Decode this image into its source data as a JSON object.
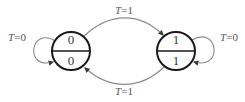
{
  "diagram": {
    "type": "state-transition-diagram",
    "background_color": "#ffffff",
    "state_stroke_color": "#1a1a1a",
    "edge_stroke_color": "#8a8a8a",
    "text_color": "#3a3a3a",
    "states": [
      {
        "id": "state-left",
        "top_value": "0",
        "bottom_value": "0",
        "cx": 71,
        "cy": 51,
        "r": 19
      },
      {
        "id": "state-right",
        "top_value": "1",
        "bottom_value": "1",
        "cx": 176,
        "cy": 51,
        "r": 19
      }
    ],
    "transitions": [
      {
        "id": "self-loop-left",
        "label_var": "T",
        "label_eq": "=0",
        "label_full": "T=0",
        "from": "state-left",
        "to": "state-left",
        "label_x": 17,
        "label_y": 38
      },
      {
        "id": "left-to-right",
        "label_var": "T",
        "label_eq": "=1",
        "label_full": "T=1",
        "from": "state-left",
        "to": "state-right",
        "label_x": 124,
        "label_y": 11
      },
      {
        "id": "right-to-left",
        "label_var": "T",
        "label_eq": "=1",
        "label_full": "T=1",
        "from": "state-right",
        "to": "state-left",
        "label_x": 124,
        "label_y": 92
      },
      {
        "id": "self-loop-right",
        "label_var": "T",
        "label_eq": "=0",
        "label_full": "T=0",
        "from": "state-right",
        "to": "state-right",
        "label_x": 229,
        "label_y": 38
      }
    ]
  }
}
